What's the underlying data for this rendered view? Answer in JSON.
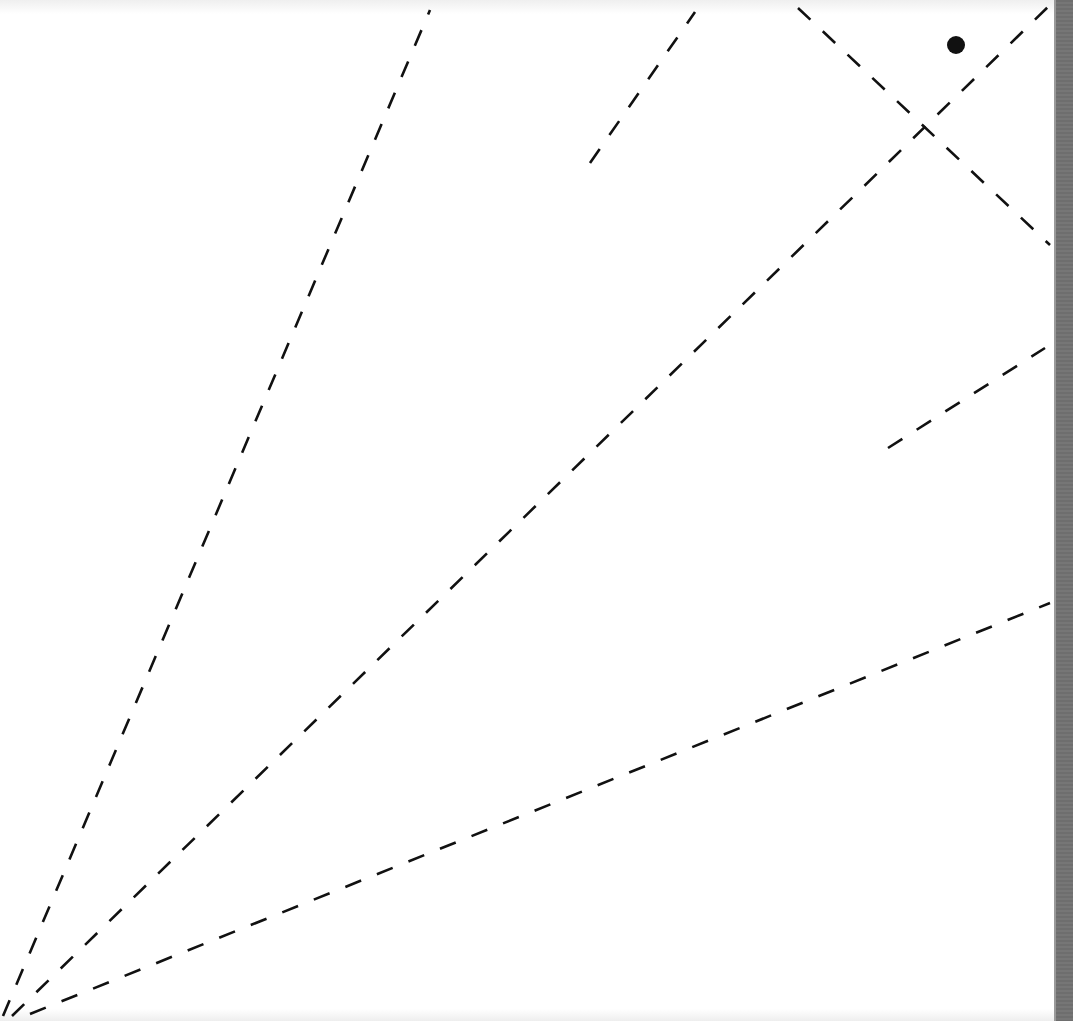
{
  "diagram": {
    "stroke_color": "#111111",
    "background": "#ffffff",
    "edge_bar_color": "#707070",
    "lines": [
      {
        "id": "ray-steep",
        "x1": 3,
        "y1": 1016,
        "x2": 430,
        "y2": 10
      },
      {
        "id": "ray-diagonal",
        "x1": 12,
        "y1": 1016,
        "x2": 1050,
        "y2": 5
      },
      {
        "id": "ray-shallow",
        "x1": 30,
        "y1": 1014,
        "x2": 1050,
        "y2": 603
      },
      {
        "id": "segment-upper-mid",
        "x1": 590,
        "y1": 163,
        "x2": 695,
        "y2": 12
      },
      {
        "id": "segment-descending",
        "x1": 798,
        "y1": 8,
        "x2": 1050,
        "y2": 245
      },
      {
        "id": "segment-right-mid",
        "x1": 888,
        "y1": 448,
        "x2": 1045,
        "y2": 348
      }
    ],
    "points": [
      {
        "id": "dot",
        "cx": 956,
        "cy": 45,
        "r": 9
      }
    ]
  }
}
